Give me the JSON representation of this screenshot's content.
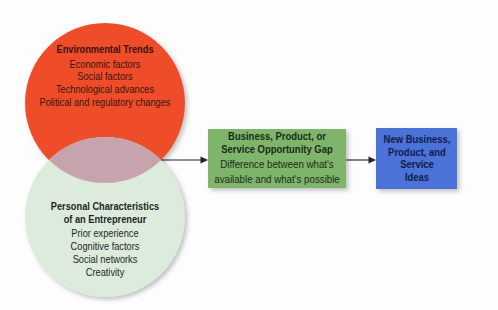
{
  "diagram": {
    "environmental_trends": {
      "title": "Environmental Trends",
      "items": [
        "Economic factors",
        "Social factors",
        "Technological advances",
        "Political and regulatory changes"
      ]
    },
    "personal_characteristics": {
      "title_lines": [
        "Personal Characteristics",
        "of an Entrepreneur"
      ],
      "items": [
        "Prior experience",
        "Cognitive factors",
        "Social networks",
        "Creativity"
      ]
    },
    "opportunity_gap": {
      "title_lines": [
        "Business, Product, or",
        "Service Opportunity Gap"
      ],
      "description_lines": [
        "Difference between what's",
        "available and what's possible"
      ]
    },
    "new_ideas": {
      "lines": [
        "New Business,",
        "Product, and",
        "Service",
        "Ideas"
      ]
    },
    "arrows": [
      {
        "from": "circles-intersection",
        "to": "opportunity_gap"
      },
      {
        "from": "opportunity_gap",
        "to": "new_ideas"
      }
    ]
  },
  "colors": {
    "environmental_circle": "#ef4e2c",
    "personal_circle": "#ddebdc",
    "overlap": "#c7a3ae",
    "gap_box": "#7fb56a",
    "ideas_box": "#4c72d6",
    "arrow": "#222222",
    "shadow": "#8a8a8a"
  }
}
